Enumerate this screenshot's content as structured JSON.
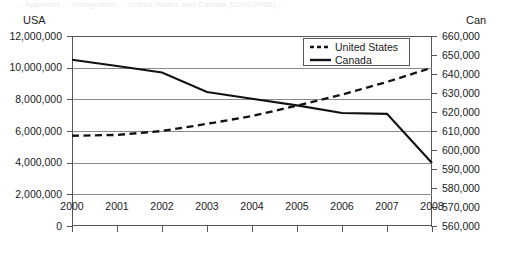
{
  "faint_header": "...Appendix ... Immigration ... United States and Canada (2000-2008) ...",
  "axis_captions": {
    "left": "USA",
    "right": "Can"
  },
  "legend": {
    "position": "top-right-inside",
    "entries": [
      {
        "label": "United States",
        "style": "dashed",
        "icon": "dashed-line-swatch"
      },
      {
        "label": "Canada",
        "style": "solid",
        "icon": "solid-line-swatch"
      }
    ]
  },
  "chart_data": {
    "type": "line",
    "title": "",
    "subtitle": "",
    "xlabel": "",
    "ylabel": "USA",
    "y2label": "Can",
    "grid": true,
    "x": [
      2000,
      2001,
      2002,
      2003,
      2004,
      2005,
      2006,
      2007,
      2008
    ],
    "categories": [
      "2000",
      "2001",
      "2002",
      "2003",
      "2004",
      "2005",
      "2006",
      "2007",
      "2008"
    ],
    "ylim": [
      0,
      12000000
    ],
    "yticks": [
      0,
      2000000,
      4000000,
      6000000,
      8000000,
      10000000,
      12000000
    ],
    "ytick_labels": [
      "0",
      "2,000,000",
      "4,000,000",
      "6,000,000",
      "8,000,000",
      "10,000,000",
      "12,000,000"
    ],
    "y2lim": [
      560000,
      660000
    ],
    "y2ticks": [
      560000,
      570000,
      580000,
      590000,
      600000,
      610000,
      620000,
      630000,
      640000,
      650000,
      660000
    ],
    "y2tick_labels": [
      "560,000",
      "570,000",
      "580,000",
      "590,000",
      "600,000",
      "610,000",
      "620,000",
      "630,000",
      "640,000",
      "650,000",
      "660,000"
    ],
    "series": [
      {
        "name": "United States",
        "axis": "left",
        "style": "dashed",
        "values": [
          5700000,
          5750000,
          6000000,
          6450000,
          6950000,
          7600000,
          8300000,
          9100000,
          10000000
        ]
      },
      {
        "name": "Canada",
        "axis": "right",
        "style": "solid",
        "values": [
          647500,
          644200,
          640800,
          630500,
          627000,
          623500,
          619500,
          619000,
          593200
        ]
      }
    ]
  }
}
